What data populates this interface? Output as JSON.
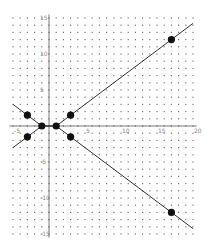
{
  "chart_data": {
    "type": "scatter",
    "title": "",
    "xlabel": "",
    "ylabel": "",
    "xlim": [
      -5.5,
      20.5
    ],
    "ylim": [
      -15.5,
      15.5
    ],
    "grid": "dotted",
    "x_ticks": [
      -5,
      5,
      10,
      15,
      20
    ],
    "y_ticks": [
      15,
      10,
      5,
      -5,
      -10,
      -15
    ],
    "x_tick_labels": [
      "-5",
      "5",
      "10",
      "15",
      "20"
    ],
    "y_tick_labels": [
      "15",
      "10",
      "5",
      "-5",
      "-10",
      "-15"
    ],
    "series": [
      {
        "name": "points",
        "x": [
          -3,
          -1,
          1,
          3,
          17,
          -3,
          3,
          17
        ],
        "y": [
          1.5,
          0,
          0,
          1.5,
          12,
          -1.5,
          -1.5,
          -12
        ]
      },
      {
        "name": "upper line",
        "type": "line",
        "x": [
          -5,
          -1,
          1,
          20
        ],
        "y": [
          3,
          0,
          0,
          14.25
        ]
      },
      {
        "name": "lower line",
        "type": "line",
        "x": [
          -5,
          -1,
          1,
          20
        ],
        "y": [
          -3,
          0,
          0,
          -14.25
        ]
      }
    ]
  },
  "colors": {
    "line": "#333333",
    "point": "#111111",
    "grid_dot": "#777777",
    "axis": "#555555"
  }
}
